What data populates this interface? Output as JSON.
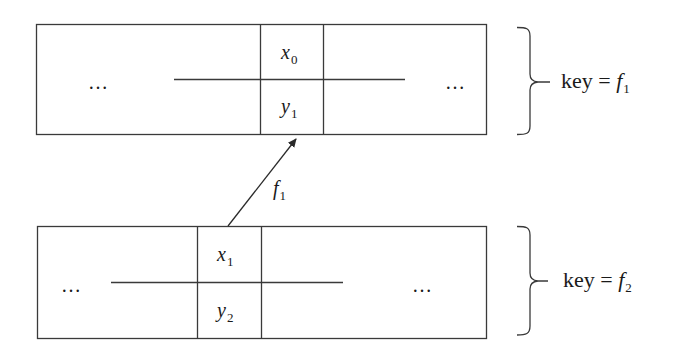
{
  "diagram": {
    "type": "hash-table-chain",
    "top_table": {
      "left_ellipsis": "…",
      "right_ellipsis": "…",
      "cell_top": {
        "var": "x",
        "sub": "0"
      },
      "cell_bottom": {
        "var": "y",
        "sub": "1"
      },
      "brace_label": {
        "prefix": "key = ",
        "var": "f",
        "sub": "1"
      }
    },
    "bottom_table": {
      "left_ellipsis": "…",
      "right_ellipsis": "…",
      "cell_top": {
        "var": "x",
        "sub": "1"
      },
      "cell_bottom": {
        "var": "y",
        "sub": "2"
      },
      "brace_label": {
        "prefix": "key = ",
        "var": "f",
        "sub": "2"
      }
    },
    "arrow": {
      "from": "bottom_table.cell_top",
      "to": "top_table.cell_bottom",
      "label": {
        "var": "f",
        "sub": "1"
      }
    },
    "colors": {
      "line": "#3a3a3a",
      "text": "#1a1a1a",
      "background": "#ffffff"
    }
  }
}
